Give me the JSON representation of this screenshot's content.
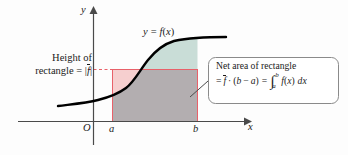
{
  "figure": {
    "background_color": "#fdfdfd",
    "width": 348,
    "height": 155
  },
  "axes": {
    "y_label": "y",
    "x_label": "x",
    "origin_label": "O",
    "tick_a_label": "a",
    "tick_b_label": "b",
    "axis_color": "#4a4a4a"
  },
  "curve": {
    "label": "y = f(x)",
    "color": "#000000",
    "label_parts": {
      "y": "y",
      "eq": "=",
      "f": "f",
      "open": "(",
      "x": "x",
      "close": ")"
    }
  },
  "height_label": {
    "line1": "Height of",
    "line2_prefix": "rectangle = ",
    "line2_bar_open": "|",
    "line2_f": "f",
    "line2_bar_close": "|"
  },
  "callout": {
    "line1": "Net area of rectangle",
    "formula": {
      "eq1": "=",
      "fbar": "f",
      "dot": "·",
      "open": "(",
      "b": "b",
      "minus": "−",
      "a": "a",
      "close": ")",
      "eq2": "=",
      "integral_sign": "∫",
      "upper_limit": "b",
      "lower_limit": "a",
      "integrand_f": "f",
      "integrand_open": "(",
      "integrand_x": "x",
      "integrand_close": ")",
      "dx": "dx"
    },
    "border_color": "#8a8a8a",
    "fill_color": "#ffffff"
  },
  "regions": {
    "rectangle_below_curve_fill": "#b3aeb0",
    "rectangle_above_curve_fill": "#f6cfcf",
    "curve_above_rectangle_fill": "#c9ddd7",
    "rectangle_border_color": "#e8616a",
    "dashed_line_color": "#e8616a"
  }
}
